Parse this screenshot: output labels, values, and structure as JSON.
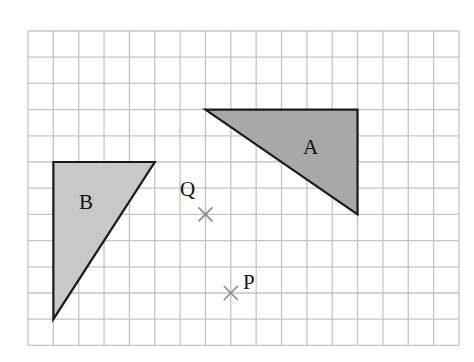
{
  "grid": {
    "x0": 28,
    "y0": 31,
    "cols": 17,
    "rows": 12,
    "cell_w": 25.35,
    "cell_h": 26.2,
    "line_color": "#c4c4c4"
  },
  "shapes": [
    {
      "name": "A",
      "label": "A",
      "fill": "#a8a8a8",
      "stroke": "#1a1a1a",
      "vertices_grid": [
        [
          7,
          3
        ],
        [
          13,
          3
        ],
        [
          13,
          7
        ]
      ],
      "label_pos": [
        313,
        154
      ]
    },
    {
      "name": "B",
      "label": "B",
      "fill": "#c8c8c8",
      "stroke": "#1a1a1a",
      "vertices_grid": [
        [
          1,
          5
        ],
        [
          5,
          5
        ],
        [
          1,
          11
        ]
      ],
      "label_pos": [
        88,
        209
      ]
    }
  ],
  "points": [
    {
      "name": "Q",
      "label": "Q",
      "grid": [
        7,
        7
      ],
      "label_pos": [
        181,
        194
      ]
    },
    {
      "name": "P",
      "label": "P",
      "grid": [
        8,
        10
      ],
      "label_pos": [
        244,
        288
      ]
    }
  ],
  "labels": {
    "A": "A",
    "B": "B",
    "P": "P",
    "Q": "Q"
  }
}
